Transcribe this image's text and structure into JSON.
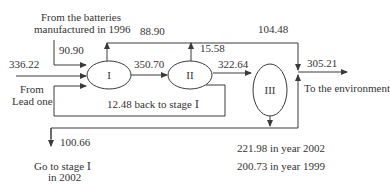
{
  "nodes": [
    {
      "id": "I",
      "label": "I"
    },
    {
      "id": "II",
      "label": "II"
    },
    {
      "id": "III",
      "label": "III"
    }
  ],
  "labels": {
    "batteries_source": "From the batteries",
    "batteries_source_line2": "manufactured in 1996",
    "batteries_value": "90.90",
    "lead_input_value": "336.22",
    "lead_source": "From",
    "lead_source_line2": "Lead one",
    "i_to_ii": "350.70",
    "top_bypass": "88.90",
    "ii_up": "15.58",
    "ii_to_iii": "322.64",
    "top_right": "104.48",
    "env_output": "305.21",
    "env_label": "To the environment",
    "back_to_stage": "12.48 back to stage Ⅰ",
    "go_stage_value": "100.66",
    "go_stage_label": "Go to stage Ⅰ",
    "go_stage_label_line2": "in 2002",
    "year2002": "221.98 in year 2002",
    "year1999": "200.73 in year 1999"
  },
  "colors": {
    "line": "#3a3a3a",
    "text": "#333333"
  }
}
